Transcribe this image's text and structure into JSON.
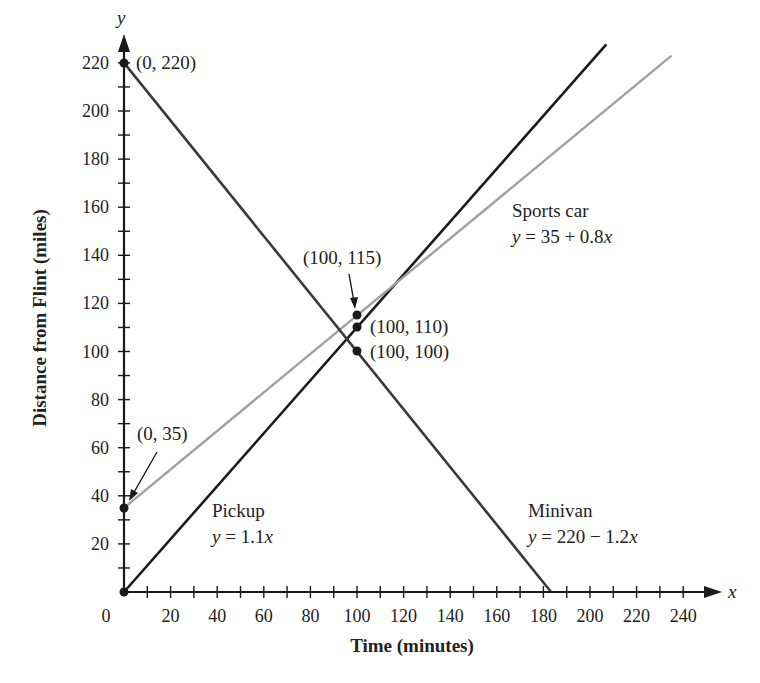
{
  "chart_data": {
    "type": "line",
    "title": "",
    "xlabel": "Time (minutes)",
    "ylabel": "Distance from Flint (miles)",
    "x_axis_letter": "x",
    "y_axis_letter": "y",
    "xlim": [
      0,
      250
    ],
    "ylim": [
      0,
      230
    ],
    "x_ticks": [
      0,
      20,
      40,
      60,
      80,
      100,
      120,
      140,
      160,
      180,
      200,
      220,
      240
    ],
    "y_ticks": [
      20,
      40,
      60,
      80,
      100,
      120,
      140,
      160,
      180,
      200,
      220
    ],
    "grid": false,
    "series": [
      {
        "name": "Pickup",
        "equation": "y = 1.1x",
        "slope": 1.1,
        "intercept": 0,
        "x": [
          0,
          207
        ],
        "y": [
          0,
          227.7
        ],
        "color": "#1a1a1a"
      },
      {
        "name": "Sports car",
        "equation": "y = 35 + 0.8x",
        "slope": 0.8,
        "intercept": 35,
        "x": [
          0,
          235
        ],
        "y": [
          35,
          223
        ],
        "color": "#a0a0a0"
      },
      {
        "name": "Minivan",
        "equation": "y = 220 − 1.2x",
        "slope": -1.2,
        "intercept": 220,
        "x": [
          0,
          183.3
        ],
        "y": [
          220,
          0
        ],
        "color": "#3a3a3a"
      }
    ],
    "points": [
      {
        "label": "(0, 220)",
        "x": 0,
        "y": 220
      },
      {
        "label": "(0, 35)",
        "x": 0,
        "y": 35
      },
      {
        "label": "(0, 0)",
        "x": 0,
        "y": 0
      },
      {
        "label": "(100, 115)",
        "x": 100,
        "y": 115
      },
      {
        "label": "(100, 110)",
        "x": 100,
        "y": 110
      },
      {
        "label": "(100, 100)",
        "x": 100,
        "y": 100
      }
    ],
    "annotations": [
      {
        "series": "Sports car",
        "name_label": "Sports car",
        "equation_label": "y = 35 + 0.8x"
      },
      {
        "series": "Pickup",
        "name_label": "Pickup",
        "equation_label": "y = 1.1x"
      },
      {
        "series": "Minivan",
        "name_label": "Minivan",
        "equation_label": "y = 220 − 1.2x"
      }
    ]
  },
  "labels": {
    "x_axis_title": "Time (minutes)",
    "y_axis_title": "Distance from Flint (miles)",
    "x_letter": "x",
    "y_letter": "y",
    "pt_0_220": "(0, 220)",
    "pt_0_35": "(0, 35)",
    "pt_100_115": "(100, 115)",
    "pt_100_110": "(100, 110)",
    "pt_100_100": "(100, 100)",
    "sports_name": "Sports car",
    "sports_eq_lhs": "y",
    "sports_eq_rhs": " = 35 + 0.8",
    "sports_eq_var": "x",
    "pickup_name": "Pickup",
    "pickup_eq_lhs": "y",
    "pickup_eq_rhs": " = 1.1",
    "pickup_eq_var": "x",
    "minivan_name": "Minivan",
    "minivan_eq_lhs": "y",
    "minivan_eq_rhs": " = 220 − 1.2",
    "minivan_eq_var": "x",
    "x_tick_labels": [
      "0",
      "20",
      "40",
      "60",
      "80",
      "100",
      "120",
      "140",
      "160",
      "180",
      "200",
      "220",
      "240"
    ],
    "y_tick_labels": [
      "20",
      "40",
      "60",
      "80",
      "100",
      "120",
      "140",
      "160",
      "180",
      "200",
      "220"
    ]
  }
}
